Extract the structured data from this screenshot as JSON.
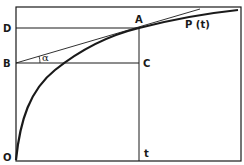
{
  "diagram": {
    "type": "function-curve-with-tangent",
    "colors": {
      "ink": "#1a1a1a",
      "background": "#ffffff"
    },
    "labels": {
      "origin": "O",
      "D": "D",
      "B": "B",
      "A": "A",
      "C": "C",
      "t": "t",
      "curve": "P (t)",
      "angle": "α"
    },
    "points": {
      "O": [
        16,
        160
      ],
      "D": [
        16,
        28
      ],
      "B": [
        16,
        63
      ],
      "A": [
        139,
        28
      ],
      "C": [
        139,
        63
      ],
      "t": [
        139,
        160
      ]
    }
  }
}
